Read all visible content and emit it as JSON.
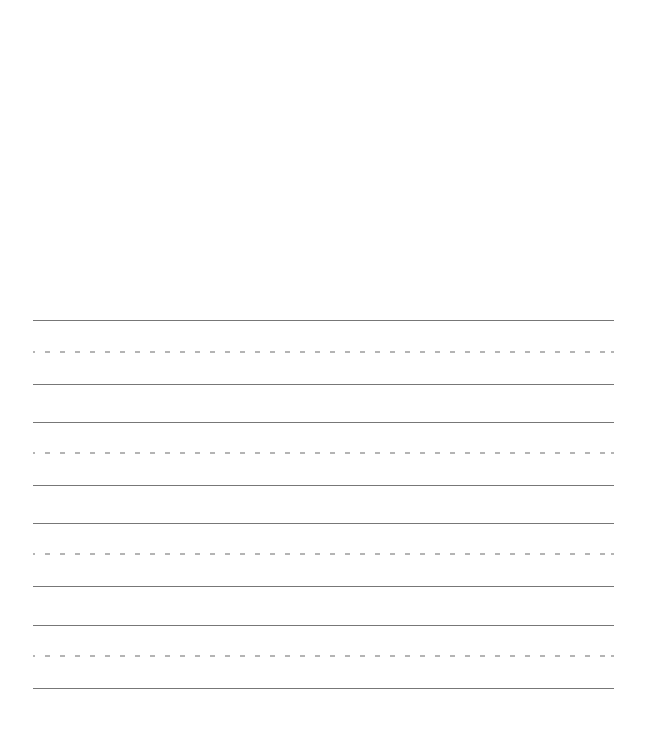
{
  "sheet": {
    "type": "handwriting-practice-paper",
    "background_color": "#ffffff",
    "line_color": "#777777",
    "dashed_line_color": "#b4b4b4",
    "line_groups": [
      {
        "top_line_y": 320,
        "midline_y": 352,
        "baseline_y": 384
      },
      {
        "top_line_y": 422,
        "midline_y": 453,
        "baseline_y": 485
      },
      {
        "top_line_y": 523,
        "midline_y": 554,
        "baseline_y": 586
      },
      {
        "top_line_y": 625,
        "midline_y": 656,
        "baseline_y": 688
      }
    ]
  }
}
